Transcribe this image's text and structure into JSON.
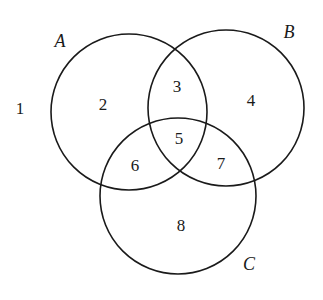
{
  "diagram": {
    "type": "venn",
    "sets": [
      {
        "id": "A",
        "label": "A"
      },
      {
        "id": "B",
        "label": "B"
      },
      {
        "id": "C",
        "label": "C"
      }
    ],
    "regions": [
      {
        "label": "1",
        "membership": []
      },
      {
        "label": "2",
        "membership": [
          "A"
        ]
      },
      {
        "label": "3",
        "membership": [
          "A",
          "B"
        ]
      },
      {
        "label": "4",
        "membership": [
          "B"
        ]
      },
      {
        "label": "5",
        "membership": [
          "A",
          "B",
          "C"
        ]
      },
      {
        "label": "6",
        "membership": [
          "A",
          "C"
        ]
      },
      {
        "label": "7",
        "membership": [
          "B",
          "C"
        ]
      },
      {
        "label": "8",
        "membership": [
          "C"
        ]
      }
    ],
    "stroke_color": "#1a1a1a",
    "background": "#ffffff"
  }
}
